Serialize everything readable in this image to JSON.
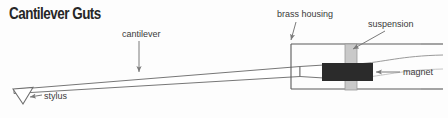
{
  "figure": {
    "title": "Cantilever Guts",
    "width": 448,
    "height": 118,
    "background_color": "#fdfdfd"
  },
  "labels": {
    "cantilever": "cantilever",
    "brass_housing": "brass housing",
    "suspension": "suspension",
    "magnet": "magnet",
    "stylus": "stylus"
  },
  "colors": {
    "title_text": "#272727",
    "label_text": "#3a3a3a",
    "outline": "#6e6e6e",
    "housing_stroke": "#5a5a5a",
    "suspension_fill": "#c9c9c9",
    "suspension_stroke": "#8d8d8d",
    "magnet_fill": "#2b2b2b",
    "leader_line": "#7a7a7a"
  },
  "parts": {
    "cantilever": {
      "name": "cantilever",
      "description": "long thin tapering wedge running from stylus tip at left into the brass housing at right"
    },
    "stylus": {
      "name": "stylus",
      "description": "small downward-pointing outlined triangle at the left tip of the cantilever"
    },
    "brass_housing": {
      "name": "brass housing",
      "description": "open rectangular outline enclosing the suspension and magnet at the right end"
    },
    "suspension": {
      "name": "suspension",
      "description": "vertical light-gray band crossing the housing, holding the cantilever"
    },
    "magnet": {
      "name": "magnet",
      "description": "solid dark block mounted on the cantilever inside the housing"
    }
  },
  "leaders": [
    {
      "name": "cantilever-leader",
      "from": "cantilever label",
      "to": "cantilever wedge"
    },
    {
      "name": "brass-housing-leader",
      "from": "brass housing label",
      "to": "housing top-left edge"
    },
    {
      "name": "suspension-leader",
      "from": "suspension label",
      "to": "suspension band"
    },
    {
      "name": "magnet-leader",
      "from": "magnet label",
      "to": "magnet block"
    },
    {
      "name": "stylus-leader",
      "from": "stylus label",
      "to": "stylus triangle"
    }
  ]
}
